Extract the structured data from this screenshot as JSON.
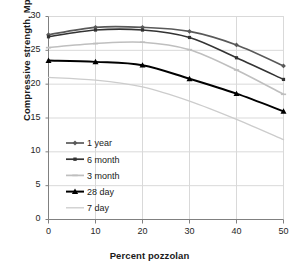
{
  "chart_data": {
    "type": "line",
    "title": "",
    "xlabel": "Percent pozzolan",
    "ylabel": "Compressive strength, Mpa",
    "x": [
      0,
      10,
      20,
      30,
      40,
      50
    ],
    "xlim": [
      0,
      50
    ],
    "ylim": [
      0,
      30
    ],
    "xticks": [
      "0",
      "10",
      "20",
      "30",
      "40",
      "50"
    ],
    "yticks": [
      "0",
      "5",
      "10",
      "15",
      "20",
      "25",
      "30"
    ],
    "grid": "horizontal-and-vertical",
    "legend_position": "center-left-inside",
    "series": [
      {
        "name": "1 year",
        "values": [
          27.3,
          28.4,
          28.4,
          27.8,
          25.8,
          22.7
        ],
        "color": "#595959",
        "marker": "diamond"
      },
      {
        "name": "6 month",
        "values": [
          27.0,
          28.0,
          28.0,
          26.9,
          23.9,
          20.7
        ],
        "color": "#333333",
        "marker": "square"
      },
      {
        "name": "3 month",
        "values": [
          25.4,
          26.0,
          26.2,
          25.1,
          22.1,
          18.5
        ],
        "color": "#bfbfbf",
        "marker": "dash"
      },
      {
        "name": "28 day",
        "values": [
          23.5,
          23.3,
          22.8,
          20.8,
          18.6,
          16.0
        ],
        "color": "#000000",
        "marker": "triangle"
      },
      {
        "name": "7 day",
        "values": [
          21.0,
          20.6,
          19.6,
          17.5,
          14.8,
          11.8
        ],
        "color": "#cccccc",
        "marker": "none"
      }
    ]
  },
  "legend": {
    "entries": [
      {
        "label": "1 year"
      },
      {
        "label": "6 month"
      },
      {
        "label": "3 month"
      },
      {
        "label": "28 day"
      },
      {
        "label": "7 day"
      }
    ]
  }
}
